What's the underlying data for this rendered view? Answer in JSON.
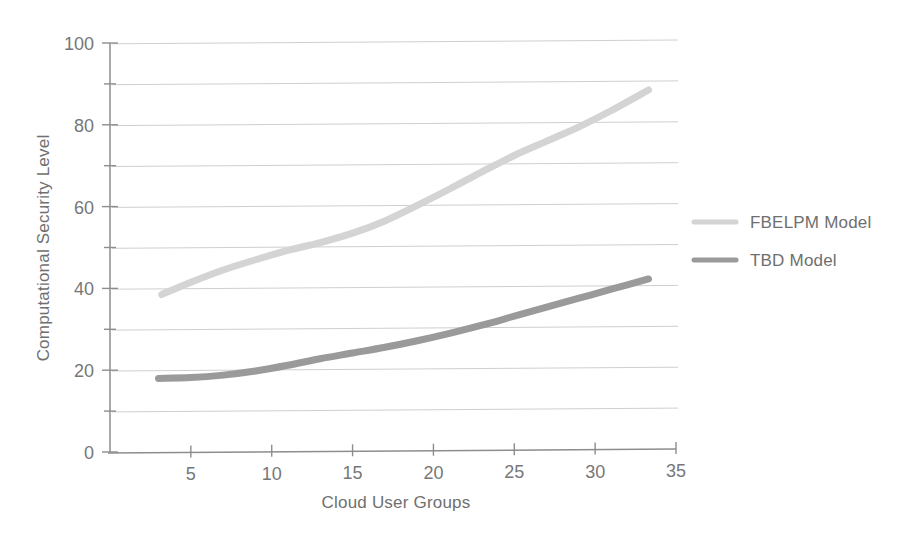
{
  "chart_data": {
    "type": "line",
    "title": "",
    "xlabel": "Cloud User Groups",
    "ylabel": "Computational Security Level",
    "xlim": [
      0,
      35
    ],
    "ylim": [
      0,
      100
    ],
    "xticks": [
      5,
      10,
      15,
      20,
      25,
      30,
      35
    ],
    "xtick_labels": [
      "5",
      "10",
      "15",
      "20",
      "25",
      "30",
      "35"
    ],
    "yticks": [
      0,
      20,
      40,
      60,
      80,
      100
    ],
    "ytick_labels": [
      "0",
      "20",
      "40",
      "60",
      "80",
      "100"
    ],
    "yminorticks": [
      10,
      30,
      50,
      70,
      90
    ],
    "grid": "horizontal-major-and-minor",
    "legend_position": "right-outside",
    "series": [
      {
        "name": "FBELPM Model",
        "color": "#d4d4d4",
        "linewidth": 7,
        "x": [
          3.2,
          5,
          7,
          9,
          11,
          13,
          15,
          17,
          19,
          21,
          23,
          25,
          27,
          29,
          31,
          33.3
        ],
        "y": [
          38.5,
          41.5,
          44.5,
          47.0,
          49.3,
          51.2,
          53.5,
          56.5,
          60.3,
          64.3,
          68.5,
          72.5,
          76.0,
          79.5,
          83.5,
          88.5
        ]
      },
      {
        "name": "TBD Model",
        "color": "#9a9a9a",
        "linewidth": 7,
        "x": [
          3.0,
          5,
          7,
          9,
          11,
          13,
          15,
          17,
          19,
          21,
          23,
          25,
          27,
          29,
          31,
          33.3
        ],
        "y": [
          18.0,
          18.2,
          18.8,
          19.8,
          21.2,
          22.8,
          24.2,
          25.6,
          27.2,
          29.0,
          31.0,
          33.2,
          35.4,
          37.6,
          39.8,
          42.3
        ]
      }
    ]
  },
  "legend": {
    "items": [
      {
        "label": "FBELPM Model",
        "color": "#d4d4d4"
      },
      {
        "label": "TBD Model",
        "color": "#9a9a9a"
      }
    ]
  },
  "axes": {
    "x_title": "Cloud User Groups",
    "y_title": "Computational Security Level"
  }
}
